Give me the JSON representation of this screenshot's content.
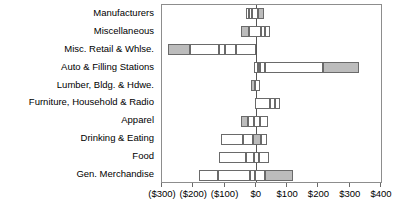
{
  "chart_data": {
    "type": "bar",
    "title": "",
    "xlabel": "",
    "ylabel": "",
    "orientation": "horizontal",
    "grid": false,
    "legend": null,
    "xlim": [
      -300,
      400
    ],
    "xticks": [
      -300,
      -200,
      -100,
      0,
      100,
      200,
      300,
      400
    ],
    "xtick_labels": [
      "($300)",
      "($200)",
      "($100)",
      "$0",
      "$100",
      "$200",
      "$300",
      "$400"
    ],
    "zero_reference": 0,
    "categories": [
      "Manufacturers",
      "Miscellaneous",
      "Misc. Retail & Whlse.",
      "Auto & Filling Stations",
      "Lumber, Bldg. & Hdwe.",
      "Furniture, Household & Radio",
      "Apparel",
      "Drinking & Eating",
      "Food",
      "Gen. Merchandise"
    ],
    "series": [
      {
        "name": "Manufacturers",
        "range_start": -33,
        "range_end": 25,
        "segments": [
          {
            "from": -33,
            "to": -22,
            "fill": "open"
          },
          {
            "from": -22,
            "to": -11,
            "fill": "open"
          },
          {
            "from": -11,
            "to": 6,
            "fill": "open"
          },
          {
            "from": 6,
            "to": 25,
            "fill": "fill"
          }
        ]
      },
      {
        "name": "Miscellaneous",
        "range_start": -46,
        "range_end": 46,
        "segments": [
          {
            "from": -46,
            "to": -22,
            "fill": "fill"
          },
          {
            "from": -22,
            "to": 15,
            "fill": "open"
          },
          {
            "from": 15,
            "to": 30,
            "fill": "open"
          },
          {
            "from": 30,
            "to": 46,
            "fill": "open"
          }
        ]
      },
      {
        "name": "Misc. Retail & Whlse.",
        "range_start": -280,
        "range_end": 2,
        "segments": [
          {
            "from": -280,
            "to": -210,
            "fill": "fill"
          },
          {
            "from": -210,
            "to": -118,
            "fill": "open"
          },
          {
            "from": -118,
            "to": -100,
            "fill": "open"
          },
          {
            "from": -100,
            "to": -62,
            "fill": "open"
          },
          {
            "from": -62,
            "to": 2,
            "fill": "open"
          }
        ]
      },
      {
        "name": "Auto & Filling Stations",
        "range_start": -6,
        "range_end": 330,
        "segments": [
          {
            "from": -6,
            "to": 6,
            "fill": "open"
          },
          {
            "from": 6,
            "to": 14,
            "fill": "open"
          },
          {
            "from": 14,
            "to": 30,
            "fill": "open"
          },
          {
            "from": 30,
            "to": 215,
            "fill": "open"
          },
          {
            "from": 215,
            "to": 330,
            "fill": "fill"
          }
        ]
      },
      {
        "name": "Lumber, Bldg. & Hdwe.",
        "range_start": -14,
        "range_end": 12,
        "segments": [
          {
            "from": -14,
            "to": -2,
            "fill": "fill"
          },
          {
            "from": -2,
            "to": 12,
            "fill": "open"
          }
        ]
      },
      {
        "name": "Furniture, Household & Radio",
        "range_start": -4,
        "range_end": 78,
        "segments": [
          {
            "from": -4,
            "to": 46,
            "fill": "open"
          },
          {
            "from": 46,
            "to": 60,
            "fill": "open"
          },
          {
            "from": 60,
            "to": 78,
            "fill": "open"
          }
        ]
      },
      {
        "name": "Apparel",
        "range_start": -48,
        "range_end": 40,
        "segments": [
          {
            "from": -48,
            "to": -26,
            "fill": "fill"
          },
          {
            "from": -26,
            "to": -6,
            "fill": "open"
          },
          {
            "from": -6,
            "to": 14,
            "fill": "open"
          },
          {
            "from": 14,
            "to": 40,
            "fill": "open"
          }
        ]
      },
      {
        "name": "Drinking & Eating",
        "range_start": -112,
        "range_end": 36,
        "segments": [
          {
            "from": -112,
            "to": -40,
            "fill": "open"
          },
          {
            "from": -40,
            "to": -8,
            "fill": "open"
          },
          {
            "from": -8,
            "to": 18,
            "fill": "fill"
          },
          {
            "from": 18,
            "to": 36,
            "fill": "open"
          }
        ]
      },
      {
        "name": "Food",
        "range_start": -118,
        "range_end": 42,
        "segments": [
          {
            "from": -118,
            "to": -30,
            "fill": "open"
          },
          {
            "from": -30,
            "to": -6,
            "fill": "open"
          },
          {
            "from": -6,
            "to": 10,
            "fill": "open"
          },
          {
            "from": 10,
            "to": 42,
            "fill": "open"
          }
        ]
      },
      {
        "name": "Gen. Merchandise",
        "range_start": -182,
        "range_end": 120,
        "segments": [
          {
            "from": -182,
            "to": -120,
            "fill": "open"
          },
          {
            "from": -120,
            "to": -20,
            "fill": "open"
          },
          {
            "from": -20,
            "to": -2,
            "fill": "open"
          },
          {
            "from": -2,
            "to": 30,
            "fill": "open"
          },
          {
            "from": 30,
            "to": 120,
            "fill": "fill"
          }
        ]
      }
    ]
  }
}
